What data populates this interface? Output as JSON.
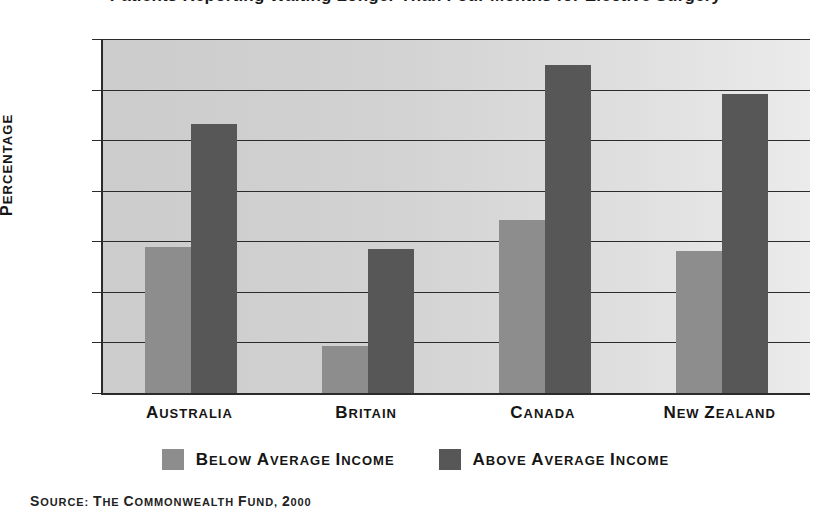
{
  "chart_data": {
    "type": "bar",
    "title": "Patients Reporting Waiting Longer Than Four Months for Elective Surgery",
    "categories": [
      "Australia",
      "Britain",
      "Canada",
      "New Zealand"
    ],
    "series": [
      {
        "name": "Below Average Income",
        "values": [
          28.8,
          9.2,
          34.2,
          28.0
        ],
        "color": "#8d8d8d"
      },
      {
        "name": "Above Average Income",
        "values": [
          53.2,
          28.5,
          64.8,
          59.2
        ],
        "color": "#575757"
      }
    ],
    "xlabel": "",
    "ylabel": "Percentage",
    "ylim": [
      0,
      70
    ],
    "yticks": [
      0,
      10,
      20,
      30,
      40,
      50,
      60,
      70
    ],
    "grid": true,
    "legend_position": "bottom",
    "source": "Source: The Commonwealth Fund, 2000"
  },
  "axis": {
    "y_label": "Percentage",
    "y_tick_labels": [
      "70",
      "60",
      "50",
      "40",
      "30",
      "20",
      "10",
      "0"
    ],
    "x_tick_labels": [
      "Australia",
      "Britain",
      "Canada",
      "New Zealand"
    ]
  },
  "legend": {
    "items": [
      {
        "label": "Below Average Income",
        "color": "#8d8d8d"
      },
      {
        "label": "Above Average Income",
        "color": "#575757"
      }
    ]
  },
  "footer": {
    "source": "Source: The Commonwealth Fund, 2000"
  },
  "colors": {
    "below_average": "#8d8d8d",
    "above_average": "#575757",
    "plot_background_left": "#cccccc",
    "plot_background_right": "#ebebeb",
    "axis": "#2b2b2b",
    "text": "#151515"
  }
}
